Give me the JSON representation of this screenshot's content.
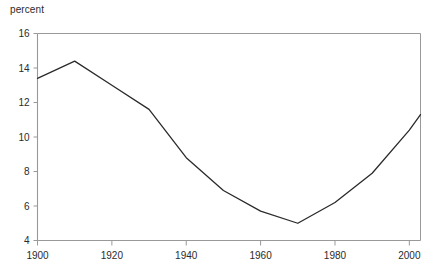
{
  "chart_data": {
    "type": "line",
    "title": "",
    "subtitle": "",
    "xlabel": "",
    "ylabel": "percent",
    "xlim": [
      1900,
      2003
    ],
    "ylim": [
      4,
      16
    ],
    "grid": false,
    "legend": "none",
    "axis_frame": "box",
    "line_color": "#2a2a2a",
    "axis_color": "#999999",
    "x": [
      1900,
      1910,
      1920,
      1930,
      1940,
      1950,
      1960,
      1970,
      1980,
      1990,
      2000,
      2003
    ],
    "values": [
      13.4,
      14.4,
      13.0,
      11.6,
      8.8,
      6.9,
      5.7,
      5.0,
      6.2,
      7.9,
      10.4,
      11.3
    ],
    "series": [
      {
        "name": "percent",
        "values": [
          13.4,
          14.4,
          13.0,
          11.6,
          8.8,
          6.9,
          5.7,
          5.0,
          6.2,
          7.9,
          10.4,
          11.3
        ]
      }
    ],
    "yticks": [
      16,
      14,
      12,
      10,
      8,
      6,
      4
    ],
    "ytick_labels": [
      "16",
      "14",
      "12",
      "10",
      "8",
      "6",
      "4"
    ],
    "xticks": [
      1900,
      1920,
      1940,
      1960,
      1980,
      2000
    ],
    "xtick_labels": [
      "1900",
      "1920",
      "1940",
      "1960",
      "1980",
      "2000"
    ]
  }
}
